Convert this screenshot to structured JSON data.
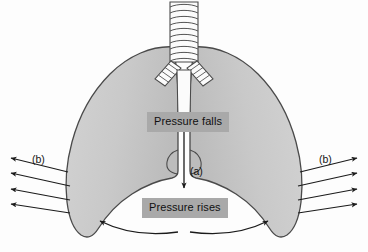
{
  "figure": {
    "background_color": "#fdfdfd"
  },
  "colors": {
    "lung_fill": "#c9c9c9",
    "lung_stroke": "#4a4a4a",
    "label_box_bg": "#a9a9a9",
    "label_text": "#101010",
    "arrow_stroke": "#1b1b1b",
    "trachea_fill": "#fbfbfb",
    "trachea_stroke": "#4a4a4a"
  },
  "labels": {
    "pressure_falls": "Pressure falls",
    "pressure_rises": "Pressure rises",
    "callout_a": "(a)",
    "callout_b_left": "(b)",
    "callout_b_right": "(b)"
  },
  "anatomy": {
    "trachea": {
      "name": "trachea",
      "ring_count": 10,
      "fill": "#fbfbfb"
    },
    "bronchus_left": {
      "name": "left-bronchus",
      "ring_count": 5
    },
    "bronchus_right": {
      "name": "right-bronchus",
      "ring_count": 5
    },
    "lung_left": {
      "name": "left-lung",
      "fill": "#c9c9c9"
    },
    "lung_right": {
      "name": "right-lung",
      "fill": "#c9c9c9"
    },
    "diaphragm": {
      "name": "diaphragm",
      "description": "curved arrows flattening downward"
    }
  },
  "arrows": {
    "vertical_a": {
      "name": "pressure-falls-to-rises-arrow",
      "direction": "down",
      "label": "(a)"
    },
    "rib_left": {
      "name": "rib-expansion-arrows-left",
      "direction": "left-outward",
      "count": 4,
      "label": "(b)"
    },
    "rib_right": {
      "name": "rib-expansion-arrows-right",
      "direction": "right-outward",
      "count": 4,
      "label": "(b)"
    },
    "diaphragm_left": {
      "name": "diaphragm-arrow-left",
      "direction": "outward-upward"
    },
    "diaphragm_right": {
      "name": "diaphragm-arrow-right",
      "direction": "outward-upward"
    }
  }
}
